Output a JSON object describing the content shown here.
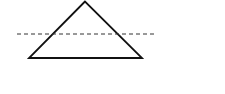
{
  "diagram": {
    "canvas": {
      "width": 225,
      "height": 94,
      "background": "#ffffff"
    },
    "triangle": {
      "points": [
        [
          85,
          1.5
        ],
        [
          29,
          58
        ],
        [
          142,
          58
        ]
      ],
      "stroke": "#111111",
      "stroke_width": 1.8,
      "fill": "none"
    },
    "dashed_line": {
      "x1": 17,
      "y1": 34,
      "x2": 157,
      "y2": 34,
      "stroke": "#333333",
      "stroke_width": 1,
      "dasharray": "4,3"
    }
  }
}
